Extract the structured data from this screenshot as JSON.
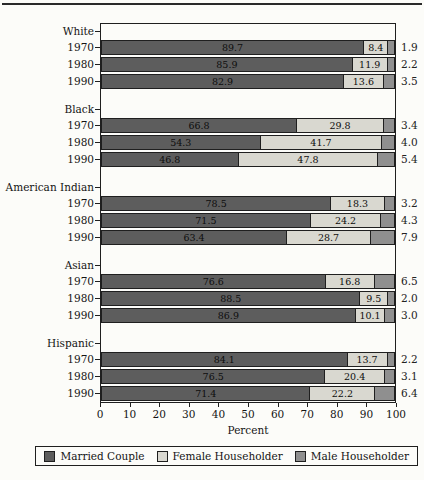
{
  "chart_data": {
    "type": "bar",
    "orientation": "horizontal-stacked",
    "xlabel": "Percent",
    "xlim": [
      0,
      100
    ],
    "xticks": [
      0,
      10,
      20,
      30,
      40,
      50,
      60,
      70,
      80,
      90,
      100
    ],
    "grid": false,
    "legend_position": "bottom",
    "series_names": [
      "Married Couple",
      "Female Householder",
      "Male Householder"
    ],
    "colors": {
      "married": "#5d5d5d",
      "female": "#d9d8d0",
      "male": "#8f8f8f",
      "frame": "#1f1f1f"
    },
    "groups": [
      {
        "label": "White",
        "rows": [
          {
            "year": "1970",
            "values": [
              89.7,
              8.4,
              1.9
            ],
            "labels": [
              "89.7",
              "8.4",
              "1.9"
            ]
          },
          {
            "year": "1980",
            "values": [
              85.9,
              11.9,
              2.2
            ],
            "labels": [
              "85.9",
              "11.9",
              "2.2"
            ]
          },
          {
            "year": "1990",
            "values": [
              82.9,
              13.6,
              3.5
            ],
            "labels": [
              "82.9",
              "13.6",
              "3.5"
            ]
          }
        ]
      },
      {
        "label": "Black",
        "rows": [
          {
            "year": "1970",
            "values": [
              66.8,
              29.8,
              3.4
            ],
            "labels": [
              "66.8",
              "29.8",
              "3.4"
            ]
          },
          {
            "year": "1980",
            "values": [
              54.3,
              41.7,
              4.0
            ],
            "labels": [
              "54.3",
              "41.7",
              "4.0"
            ]
          },
          {
            "year": "1990",
            "values": [
              46.8,
              47.8,
              5.4
            ],
            "labels": [
              "46.8",
              "47.8",
              "5.4"
            ]
          }
        ]
      },
      {
        "label": "American Indian",
        "rows": [
          {
            "year": "1970",
            "values": [
              78.5,
              18.3,
              3.2
            ],
            "labels": [
              "78.5",
              "18.3",
              "3.2"
            ]
          },
          {
            "year": "1980",
            "values": [
              71.5,
              24.2,
              4.3
            ],
            "labels": [
              "71.5",
              "24.2",
              "4.3"
            ]
          },
          {
            "year": "1990",
            "values": [
              63.4,
              28.7,
              7.9
            ],
            "labels": [
              "63.4",
              "28.7",
              "7.9"
            ]
          }
        ]
      },
      {
        "label": "Asian",
        "rows": [
          {
            "year": "1970",
            "values": [
              76.6,
              16.8,
              6.5
            ],
            "labels": [
              "76.6",
              "16.8",
              "6.5"
            ]
          },
          {
            "year": "1980",
            "values": [
              88.5,
              9.5,
              2.0
            ],
            "labels": [
              "88.5",
              "9.5",
              "2.0"
            ]
          },
          {
            "year": "1990",
            "values": [
              86.9,
              10.1,
              3.0
            ],
            "labels": [
              "86.9",
              "10.1",
              "3.0"
            ]
          }
        ]
      },
      {
        "label": "Hispanic",
        "rows": [
          {
            "year": "1970",
            "values": [
              84.1,
              13.7,
              2.2
            ],
            "labels": [
              "84.1",
              "13.7",
              "2.2"
            ]
          },
          {
            "year": "1980",
            "values": [
              76.5,
              20.4,
              3.1
            ],
            "labels": [
              "76.5",
              "20.4",
              "3.1"
            ]
          },
          {
            "year": "1990",
            "values": [
              71.4,
              22.2,
              6.4
            ],
            "labels": [
              "71.4",
              "22.2",
              "6.4"
            ]
          }
        ]
      }
    ],
    "legend": {
      "entries": [
        "Married Couple",
        "Female Householder",
        "Male Householder"
      ]
    }
  }
}
